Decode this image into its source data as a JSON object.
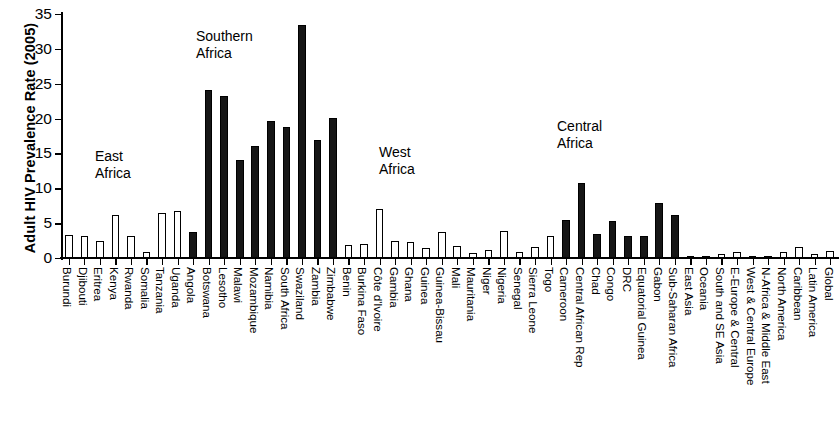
{
  "chart_data": {
    "type": "bar",
    "title": "",
    "xlabel": "",
    "ylabel": "Adult HIV Prevalence Rate (2005)",
    "ylim": [
      0,
      35
    ],
    "ytick_values": [
      0,
      5,
      10,
      15,
      20,
      25,
      30,
      35
    ],
    "ytick_labels": [
      "0",
      "5",
      "10",
      "15",
      "20",
      "25",
      "30",
      "35"
    ],
    "grid": false,
    "legend": "none",
    "categories": [
      "Burundi",
      "Djibouti",
      "Eritrea",
      "Kenya",
      "Rwanda",
      "Somalia",
      "Tanzania",
      "Uganda",
      "Angola",
      "Botswana",
      "Lesotho",
      "Malawi",
      "Mozambique",
      "Namibia",
      "South Africa",
      "Swaziland",
      "Zambia",
      "Zimbabwe",
      "Benin",
      "Burkina Faso",
      "Côte d'Ivoire",
      "Gambia",
      "Ghana",
      "Guinea",
      "Guinea-Bissau",
      "Mali",
      "Mauritania",
      "Niger",
      "Nigeria",
      "Senegal",
      "Sierra Leone",
      "Togo",
      "Cameroon",
      "Central African Rep",
      "Chad",
      "Congo",
      "DRC",
      "Equatorial Guinea",
      "Gabon",
      "Sub-Saharan Africa",
      "East Asia",
      "Oceania",
      "South and SE Asia",
      "E-Europe & Central",
      "West & Central Europe",
      "N-Africa & Middle East",
      "North America",
      "Caribbean",
      "Latin America",
      "Global"
    ],
    "values": [
      3.3,
      3.1,
      2.4,
      6.1,
      3.1,
      0.9,
      6.5,
      6.7,
      3.7,
      24.1,
      23.2,
      14.1,
      16.1,
      19.6,
      18.8,
      33.4,
      17.0,
      20.1,
      1.8,
      2.0,
      7.1,
      2.4,
      2.3,
      1.5,
      3.8,
      1.7,
      0.7,
      1.1,
      3.9,
      0.9,
      1.6,
      3.2,
      5.4,
      10.7,
      3.5,
      5.3,
      3.2,
      3.2,
      7.9,
      6.1,
      0.1,
      0.3,
      0.6,
      0.8,
      0.3,
      0.2,
      0.8,
      1.6,
      0.6,
      1.0
    ],
    "bar_styles": [
      "hollow",
      "hollow",
      "hollow",
      "hollow",
      "hollow",
      "hollow",
      "hollow",
      "hollow",
      "filled",
      "filled",
      "filled",
      "filled",
      "filled",
      "filled",
      "filled",
      "filled",
      "filled",
      "filled",
      "hollow",
      "hollow",
      "hollow",
      "hollow",
      "hollow",
      "hollow",
      "hollow",
      "hollow",
      "hollow",
      "hollow",
      "hollow",
      "hollow",
      "hollow",
      "hollow",
      "filled",
      "filled",
      "filled",
      "filled",
      "filled",
      "filled",
      "filled",
      "filled",
      "hollow",
      "hollow",
      "hollow",
      "hollow",
      "hollow",
      "hollow",
      "hollow",
      "hollow",
      "hollow",
      "hollow"
    ],
    "annotations": [
      {
        "text": "East\nAfrica",
        "x_px": 95,
        "y_px": 148
      },
      {
        "text": "Southern\nAfrica",
        "x_px": 196,
        "y_px": 28
      },
      {
        "text": "West\nAfrica",
        "x_px": 379,
        "y_px": 144
      },
      {
        "text": "Central\nAfrica",
        "x_px": 557,
        "y_px": 118
      }
    ],
    "colors": {
      "filled_bar": "#161616",
      "hollow_bar": "#ffffff",
      "bar_outline": "#000000",
      "axis": "#000000",
      "background": "#ffffff"
    }
  }
}
